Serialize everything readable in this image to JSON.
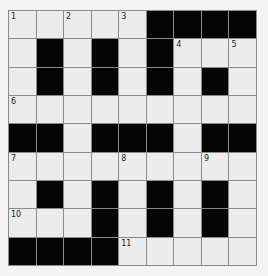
{
  "puzzle": {
    "rows": 9,
    "cols": 9,
    "colors": {
      "black": "#050505",
      "white": "#ececec",
      "border": "#8a8a8a"
    },
    "grid": [
      [
        "1",
        "W",
        "2",
        "W",
        "3",
        "B",
        "B",
        "B",
        "B"
      ],
      [
        "W",
        "B",
        "W",
        "B",
        "W",
        "B",
        "4",
        "W",
        "5"
      ],
      [
        "W",
        "B",
        "W",
        "B",
        "W",
        "B",
        "W",
        "B",
        "W"
      ],
      [
        "6",
        "W",
        "W",
        "W",
        "W",
        "W",
        "W",
        "W",
        "W"
      ],
      [
        "B",
        "B",
        "W",
        "B",
        "B",
        "B",
        "W",
        "B",
        "B"
      ],
      [
        "7",
        "W",
        "W",
        "W",
        "8",
        "W",
        "W",
        "9",
        "W"
      ],
      [
        "W",
        "B",
        "W",
        "B",
        "W",
        "B",
        "W",
        "B",
        "W"
      ],
      [
        "10",
        "W",
        "W",
        "B",
        "W",
        "B",
        "W",
        "B",
        "W"
      ],
      [
        "B",
        "B",
        "B",
        "B",
        "11",
        "W",
        "W",
        "W",
        "W"
      ]
    ]
  }
}
